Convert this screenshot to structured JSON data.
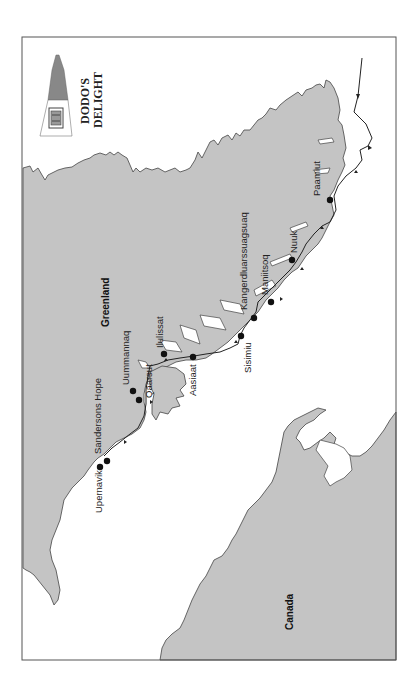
{
  "map": {
    "title_line1": "DODO'S",
    "title_line2": "DELIGHT",
    "regions": {
      "greenland": "Greenland",
      "canada": "Canada"
    },
    "ports": [
      {
        "name": "Paamiut"
      },
      {
        "name": "Nuuk"
      },
      {
        "name": "Maniitsoq"
      },
      {
        "name": "Kangerdluarssuagsuaq"
      },
      {
        "name": "Sisimiu"
      },
      {
        "name": "Aasiaat"
      },
      {
        "name": "Ilulissat"
      },
      {
        "name": "Qaarsut"
      },
      {
        "name": "Uummannaq"
      },
      {
        "name": "Sandersons Hope"
      },
      {
        "name": "Upernavik"
      }
    ],
    "colors": {
      "land": "#c4c4c4",
      "sea": "#ffffff",
      "route": "#222222"
    },
    "orientation": "rotated 90 degrees counter-clockwise"
  }
}
